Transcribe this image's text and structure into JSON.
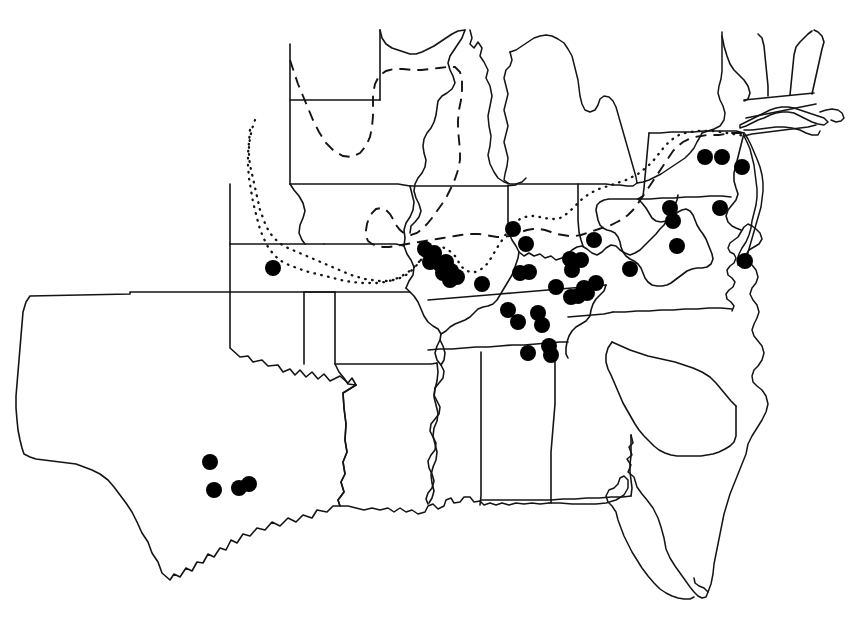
{
  "figure": {
    "name": "species-distribution-map",
    "region": "Central and Eastern United States",
    "background_color": "#ffffff",
    "line_color": "#141414",
    "dot_color": "#000000",
    "width": 865,
    "height": 636,
    "caption": "",
    "title": ""
  },
  "legend": {
    "visible": false,
    "entries": [
      {
        "symbol": "filled-circle",
        "label": "collection locality",
        "color": "#000000"
      },
      {
        "symbol": "dashed-line",
        "label": "range boundary (dashed)",
        "color": "#141414"
      },
      {
        "symbol": "dotted-line",
        "label": "range boundary (dotted)",
        "color": "#141414"
      }
    ]
  },
  "chart_data": {
    "type": "scatter",
    "title": "",
    "xlabel": "",
    "ylabel": "",
    "coordinate_space": "image pixels (865 x 636)",
    "dot_radius": 8,
    "point_count": 47,
    "points": [
      {
        "x": 273,
        "y": 268,
        "group": "kansas-isolate"
      },
      {
        "x": 210,
        "y": 462,
        "group": "texas"
      },
      {
        "x": 214,
        "y": 490,
        "group": "texas"
      },
      {
        "x": 239,
        "y": 488,
        "group": "texas"
      },
      {
        "x": 249,
        "y": 484,
        "group": "texas"
      },
      {
        "x": 425,
        "y": 249,
        "group": "mississippi-corridor"
      },
      {
        "x": 434,
        "y": 253,
        "group": "mississippi-corridor"
      },
      {
        "x": 430,
        "y": 262,
        "group": "mississippi-corridor"
      },
      {
        "x": 440,
        "y": 264,
        "group": "mississippi-corridor"
      },
      {
        "x": 446,
        "y": 262,
        "group": "mississippi-corridor"
      },
      {
        "x": 443,
        "y": 273,
        "group": "mississippi-corridor"
      },
      {
        "x": 451,
        "y": 271,
        "group": "mississippi-corridor"
      },
      {
        "x": 450,
        "y": 280,
        "group": "mississippi-corridor"
      },
      {
        "x": 457,
        "y": 277,
        "group": "mississippi-corridor"
      },
      {
        "x": 513,
        "y": 229,
        "group": "indiana"
      },
      {
        "x": 526,
        "y": 244,
        "group": "indiana"
      },
      {
        "x": 482,
        "y": 284,
        "group": "kentucky-west"
      },
      {
        "x": 520,
        "y": 273,
        "group": "kentucky"
      },
      {
        "x": 529,
        "y": 272,
        "group": "kentucky"
      },
      {
        "x": 570,
        "y": 259,
        "group": "kentucky"
      },
      {
        "x": 572,
        "y": 270,
        "group": "kentucky"
      },
      {
        "x": 581,
        "y": 260,
        "group": "kentucky"
      },
      {
        "x": 594,
        "y": 240,
        "group": "kentucky-north"
      },
      {
        "x": 630,
        "y": 269,
        "group": "kentucky-east"
      },
      {
        "x": 556,
        "y": 287,
        "group": "tennessee-north"
      },
      {
        "x": 571,
        "y": 297,
        "group": "tennessee-north"
      },
      {
        "x": 578,
        "y": 296,
        "group": "tennessee-north"
      },
      {
        "x": 587,
        "y": 293,
        "group": "tennessee-north"
      },
      {
        "x": 584,
        "y": 288,
        "group": "tennessee-north"
      },
      {
        "x": 596,
        "y": 283,
        "group": "tennessee-north"
      },
      {
        "x": 508,
        "y": 310,
        "group": "tennessee-middle"
      },
      {
        "x": 518,
        "y": 322,
        "group": "tennessee-middle"
      },
      {
        "x": 538,
        "y": 313,
        "group": "tennessee-middle"
      },
      {
        "x": 542,
        "y": 325,
        "group": "tennessee-middle"
      },
      {
        "x": 528,
        "y": 353,
        "group": "alabama-line"
      },
      {
        "x": 549,
        "y": 346,
        "group": "alabama-line"
      },
      {
        "x": 551,
        "y": 355,
        "group": "alabama-line"
      },
      {
        "x": 670,
        "y": 208,
        "group": "west-virginia"
      },
      {
        "x": 673,
        "y": 221,
        "group": "west-virginia"
      },
      {
        "x": 677,
        "y": 246,
        "group": "west-virginia"
      },
      {
        "x": 720,
        "y": 208,
        "group": "virginia-north"
      },
      {
        "x": 745,
        "y": 261,
        "group": "virginia-coast"
      },
      {
        "x": 705,
        "y": 157,
        "group": "pennsylvania"
      },
      {
        "x": 722,
        "y": 157,
        "group": "pennsylvania"
      },
      {
        "x": 742,
        "y": 167,
        "group": "pennsylvania"
      }
    ],
    "boundary_lines": [
      {
        "name": "northern-range-dashed",
        "style": "dashed"
      },
      {
        "name": "western-range-dotted",
        "style": "dotted"
      },
      {
        "name": "interior-range-dotted",
        "style": "dotted"
      }
    ]
  }
}
